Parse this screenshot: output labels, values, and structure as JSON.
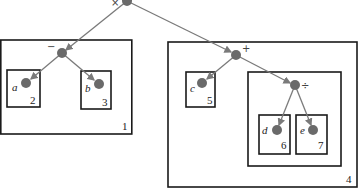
{
  "diagram": {
    "colors": {
      "node": "#6a6a6a",
      "edge": "#7a7a7a",
      "box": "#1a1a1a",
      "background": "#ffffff"
    },
    "nodes": [
      {
        "id": "times",
        "label": "×",
        "x": 127,
        "y": 1,
        "r": 5
      },
      {
        "id": "minus",
        "label": "−",
        "x": 62,
        "y": 53,
        "r": 5
      },
      {
        "id": "plus",
        "label": "+",
        "x": 236,
        "y": 55,
        "r": 5
      },
      {
        "id": "div",
        "label": "÷",
        "x": 295,
        "y": 85,
        "r": 5
      },
      {
        "id": "a",
        "label": "a",
        "x": 26,
        "y": 83,
        "r": 5
      },
      {
        "id": "b",
        "label": "b",
        "x": 99,
        "y": 84,
        "r": 5
      },
      {
        "id": "c",
        "label": "c",
        "x": 202,
        "y": 83,
        "r": 5
      },
      {
        "id": "d",
        "label": "d",
        "x": 277,
        "y": 130,
        "r": 5
      },
      {
        "id": "e",
        "label": "e",
        "x": 313,
        "y": 130,
        "r": 5
      }
    ],
    "edges": [
      {
        "from": "times",
        "to": "minus"
      },
      {
        "from": "times",
        "to": "plus"
      },
      {
        "from": "minus",
        "to": "a"
      },
      {
        "from": "minus",
        "to": "b"
      },
      {
        "from": "plus",
        "to": "c"
      },
      {
        "from": "plus",
        "to": "div"
      },
      {
        "from": "div",
        "to": "d"
      },
      {
        "from": "div",
        "to": "e"
      }
    ],
    "boxes": [
      {
        "id": "box-1",
        "number": "1",
        "x": 0,
        "y": 40,
        "w": 132,
        "h": 94
      },
      {
        "id": "box-2",
        "number": "2",
        "x": 7,
        "y": 70,
        "w": 33,
        "h": 37
      },
      {
        "id": "box-3",
        "number": "3",
        "x": 81,
        "y": 71,
        "w": 30,
        "h": 38
      },
      {
        "id": "box-4",
        "number": "4",
        "x": 168,
        "y": 42,
        "w": 189,
        "h": 145
      },
      {
        "id": "box-5",
        "number": "5",
        "x": 186,
        "y": 72,
        "w": 29,
        "h": 35
      },
      {
        "id": "box-inner",
        "number": "",
        "x": 248,
        "y": 72,
        "w": 93,
        "h": 94
      },
      {
        "id": "box-6",
        "number": "6",
        "x": 259,
        "y": 115,
        "w": 31,
        "h": 39
      },
      {
        "id": "box-7",
        "number": "7",
        "x": 296,
        "y": 115,
        "w": 31,
        "h": 39
      }
    ],
    "labels": {
      "op_times": "×",
      "op_minus": "−",
      "op_plus": "+",
      "op_div": "÷",
      "var_a": "a",
      "var_b": "b",
      "var_c": "c",
      "var_d": "d",
      "var_e": "e",
      "num_1": "1",
      "num_2": "2",
      "num_3": "3",
      "num_4": "4",
      "num_5": "5",
      "num_6": "6",
      "num_7": "7"
    }
  }
}
